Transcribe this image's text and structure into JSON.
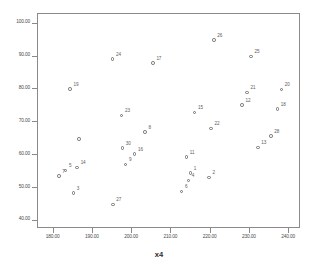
{
  "chart_data": {
    "type": "scatter",
    "title": "",
    "subtitle": "",
    "xlabel": "x4",
    "ylabel": "",
    "xlim": [
      176,
      243
    ],
    "ylim": [
      37.5,
      103
    ],
    "grid": false,
    "legend": "none",
    "marker": "open-circle",
    "x_ticks": [
      "180.00",
      "190.00",
      "200.00",
      "210.00",
      "220.00",
      "230.00",
      "240.00"
    ],
    "x_tick_values": [
      180,
      190,
      200,
      210,
      220,
      230,
      240
    ],
    "y_ticks": [
      "40.00",
      "50.00",
      "60.00",
      "70.00",
      "80.00",
      "90.00",
      "100.00"
    ],
    "y_tick_values": [
      40,
      50,
      60,
      70,
      80,
      90,
      100
    ],
    "point_label_field": "case number",
    "points": [
      {
        "label": "1",
        "x": 214.8,
        "y": 54.6
      },
      {
        "label": "2",
        "x": 219.6,
        "y": 53.2
      },
      {
        "label": "3",
        "x": 185.0,
        "y": 48.5
      },
      {
        "label": "4",
        "x": 214.3,
        "y": 52.3
      },
      {
        "label": "5",
        "x": 183.0,
        "y": 55.3
      },
      {
        "label": "6",
        "x": 212.6,
        "y": 48.9
      },
      {
        "label": "7",
        "x": 181.3,
        "y": 53.7
      },
      {
        "label": "8",
        "x": 203.3,
        "y": 67.0
      },
      {
        "label": "9",
        "x": 198.3,
        "y": 57.2
      },
      {
        "label": "11",
        "x": 213.8,
        "y": 59.4
      },
      {
        "label": "12",
        "x": 228.0,
        "y": 75.2
      },
      {
        "label": "13",
        "x": 232.0,
        "y": 62.3
      },
      {
        "label": "14",
        "x": 186.0,
        "y": 56.2
      },
      {
        "label": "15",
        "x": 215.9,
        "y": 73.0
      },
      {
        "label": "16",
        "x": 200.6,
        "y": 60.3
      },
      {
        "label": "17",
        "x": 205.3,
        "y": 88.0
      },
      {
        "label": "18",
        "x": 237.0,
        "y": 74.1
      },
      {
        "label": "19",
        "x": 184.2,
        "y": 80.1
      },
      {
        "label": "20",
        "x": 238.0,
        "y": 80.0
      },
      {
        "label": "21",
        "x": 229.3,
        "y": 79.1
      },
      {
        "label": "22",
        "x": 220.1,
        "y": 68.1
      },
      {
        "label": "23",
        "x": 197.3,
        "y": 72.1
      },
      {
        "label": "24",
        "x": 195.0,
        "y": 89.3
      },
      {
        "label": "25",
        "x": 230.3,
        "y": 90.0
      },
      {
        "label": "26",
        "x": 220.8,
        "y": 95.0
      },
      {
        "label": "27",
        "x": 195.1,
        "y": 45.0
      },
      {
        "label": "28",
        "x": 235.3,
        "y": 65.9
      },
      {
        "label": "30",
        "x": 197.5,
        "y": 62.1
      },
      {
        "label": "",
        "x": 186.5,
        "y": 65.0
      }
    ]
  }
}
